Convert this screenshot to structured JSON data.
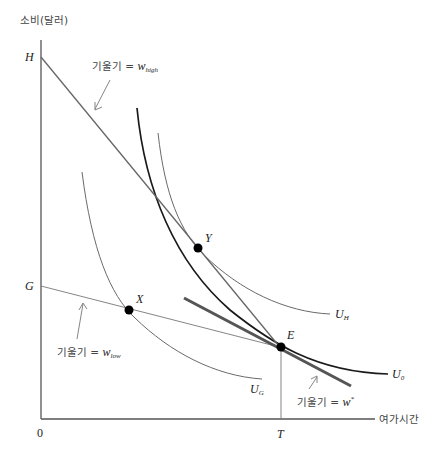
{
  "diagram": {
    "title": "",
    "axes": {
      "y_label": "소비(달러)",
      "x_label": "여가시간",
      "origin": "0",
      "y_ticks": [
        {
          "label": "H"
        },
        {
          "label": "G"
        }
      ],
      "x_ticks": [
        {
          "label": "T"
        }
      ]
    },
    "budget_lines": [
      {
        "name": "high-wage budget line",
        "annotation_prefix": "기울기 = ",
        "annotation_var": "w",
        "annotation_sub": "high",
        "from": "H",
        "to": "E"
      },
      {
        "name": "low-wage budget line",
        "annotation_prefix": "기울기 = ",
        "annotation_var": "w",
        "annotation_sub": "low",
        "from": "G",
        "to": "E"
      },
      {
        "name": "reservation-wage tangent line",
        "annotation_prefix": "기울기 = ",
        "annotation_var": "w",
        "annotation_sub": "*",
        "tangent_at": "E"
      }
    ],
    "indifference_curves": [
      {
        "label_var": "U",
        "label_sub": "H"
      },
      {
        "label_var": "U",
        "label_sub": "0"
      },
      {
        "label_var": "U",
        "label_sub": "G"
      }
    ],
    "points": [
      {
        "label": "X"
      },
      {
        "label": "Y"
      },
      {
        "label": "E"
      }
    ],
    "colors": {
      "axis": "#555555",
      "thin_line": "#6a6a6a",
      "thick_curve": "#1a1a1a",
      "tangent": "#555555",
      "point": "#000000"
    }
  }
}
